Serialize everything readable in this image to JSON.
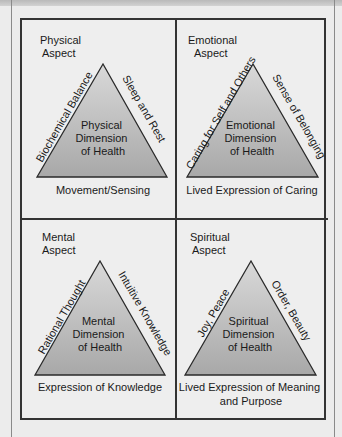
{
  "diagram": {
    "panels": [
      {
        "id": "physical",
        "aspect_lines": [
          "Physical",
          "Aspect"
        ],
        "left_side": "Biochemical Balance",
        "right_side": "Sleep and Rest",
        "center_lines": [
          "Physical",
          "Dimension",
          "of Health"
        ],
        "base_lines": [
          "Movement/Sensing"
        ]
      },
      {
        "id": "emotional",
        "aspect_lines": [
          "Emotional",
          "Aspect"
        ],
        "left_side": "Caring for Self and Others",
        "right_side": "Sense of Belonging",
        "center_lines": [
          "Emotional",
          "Dimension",
          "of Health"
        ],
        "base_lines": [
          "Lived Expression of Caring"
        ]
      },
      {
        "id": "mental",
        "aspect_lines": [
          "Mental",
          "Aspect"
        ],
        "left_side": "Rational Thought",
        "right_side": "Intuitive Knowledge",
        "center_lines": [
          "Mental",
          "Dimension",
          "of Health"
        ],
        "base_lines": [
          "Expression of Knowledge"
        ]
      },
      {
        "id": "spiritual",
        "aspect_lines": [
          "Spiritual",
          "Aspect"
        ],
        "left_side": "Joy, Peace",
        "right_side": "Order, Beauty",
        "center_lines": [
          "Spiritual",
          "Dimension",
          "of Health"
        ],
        "base_lines": [
          "Lived Expression of Meaning",
          "and Purpose"
        ]
      }
    ],
    "colors": {
      "triangle_top": "#dcdcdc",
      "triangle_bottom": "#a9a9a9",
      "outline": "#2a2a2a",
      "panel_bg": "#eeeeee"
    }
  }
}
